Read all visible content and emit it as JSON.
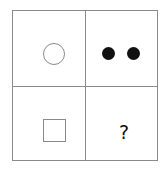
{
  "puzzle": {
    "cells": [
      {
        "position": "top-left",
        "shape": "circle-outline-icon"
      },
      {
        "position": "top-right",
        "shape": "two-filled-dots-icon"
      },
      {
        "position": "bottom-left",
        "shape": "square-outline-icon"
      },
      {
        "position": "bottom-right",
        "shape": "question-mark",
        "text": "?"
      }
    ],
    "colors": {
      "line": "#8a8a8a",
      "fill": "#111111"
    }
  }
}
